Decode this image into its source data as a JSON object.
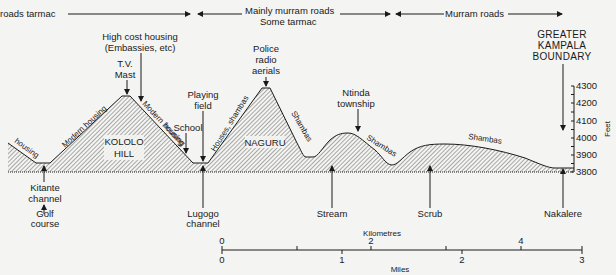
{
  "road_bands": {
    "band1": "roads tarmac",
    "band2_line1": "Mainly murram roads",
    "band2_line2": "Some tarmac",
    "band3": "Murram roads"
  },
  "top_labels": {
    "high_cost_1": "High cost housing",
    "high_cost_2": "(Embassies, etc)",
    "tv_1": "T.V.",
    "tv_2": "Mast",
    "police_1": "Police",
    "police_2": "radio",
    "police_3": "aerials",
    "playing_1": "Playing",
    "playing_2": "field",
    "school": "School",
    "ntinda_1": "Ntinda",
    "ntinda_2": "township",
    "boundary_1": "GREATER",
    "boundary_2": "KAMPALA",
    "boundary_3": "BOUNDARY"
  },
  "slope_labels": {
    "housing": "housing",
    "modern_housing_left": "Modern housing",
    "modern_housing_right": "Modern housing",
    "modern_housing_lower": "housing",
    "houses_shambas": "Houses, shambas",
    "shambas_naguru": "Shambas",
    "shambas_ntinda": "Shambas",
    "shambas_east": "Shambas"
  },
  "hill_labels": {
    "kololo_1": "KOLOLO",
    "kololo_2": "HILL",
    "naguru": "NAGURU"
  },
  "bottom_labels": {
    "kitante_1": "Kitante",
    "kitante_2": "channel",
    "golf_1": "Golf",
    "golf_2": "course",
    "lugogo_1": "Lugogo",
    "lugogo_2": "channel",
    "stream": "Stream",
    "scrub": "Scrub",
    "nakalere": "Nakalere"
  },
  "height_axis": {
    "unit": "Feet",
    "ticks": [
      "4300",
      "4200",
      "4100",
      "4000",
      "3900",
      "3800"
    ]
  },
  "scale_bar": {
    "km_label": "Kilometres",
    "km_ticks": [
      "0",
      "2",
      "4"
    ],
    "miles_label": "Miles",
    "mile_ticks": [
      "0",
      "1",
      "2",
      "3"
    ]
  },
  "colors": {
    "ink": "#1a1a1a",
    "paper": "#f4f4f2"
  }
}
